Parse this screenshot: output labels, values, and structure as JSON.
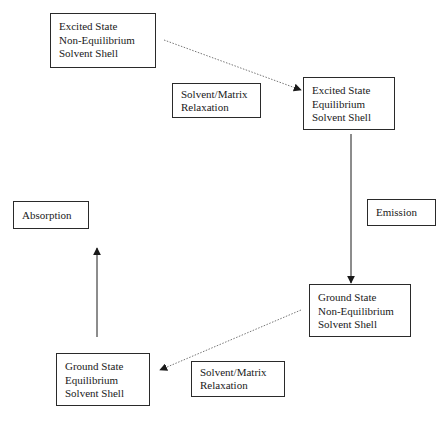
{
  "diagram": {
    "type": "solvation cycle flow diagram",
    "states": [
      {
        "id": "excited-noneq",
        "lines": [
          "Excited State",
          "Non-Equilibrium",
          "Solvent Shell"
        ]
      },
      {
        "id": "excited-eq",
        "lines": [
          "Excited State",
          "Equilibrium",
          "Solvent Shell"
        ]
      },
      {
        "id": "ground-noneq",
        "lines": [
          "Ground State",
          "Non-Equilibrium",
          "Solvent Shell"
        ]
      },
      {
        "id": "ground-eq",
        "lines": [
          "Ground State",
          "Equilibrium",
          "Solvent Shell"
        ]
      }
    ],
    "process_labels": {
      "relaxation_top": [
        "Solvent/Matrix",
        "Relaxation"
      ],
      "emission": "Emission",
      "absorption": "Absorption",
      "relaxation_bottom": [
        "Solvent/Matrix",
        "Relaxation"
      ]
    },
    "transitions": [
      {
        "from": "ground-eq",
        "to": "excited-noneq",
        "label": "Absorption",
        "style": "solid"
      },
      {
        "from": "excited-noneq",
        "to": "excited-eq",
        "label": "Solvent/Matrix Relaxation",
        "style": "dotted"
      },
      {
        "from": "excited-eq",
        "to": "ground-noneq",
        "label": "Emission",
        "style": "solid"
      },
      {
        "from": "ground-noneq",
        "to": "ground-eq",
        "label": "Solvent/Matrix Relaxation",
        "style": "dotted"
      }
    ],
    "colors": {
      "line": "#1a1a1a",
      "dotted_line": "#777777",
      "background": "#ffffff"
    }
  }
}
